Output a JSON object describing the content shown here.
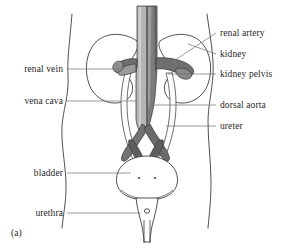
{
  "figure": {
    "caption": "(a)",
    "background_color": "#ffffff",
    "line_color": "#3a3a3a",
    "vena_cava_color": "#b3b3b3",
    "aorta_color": "#7a7a7a",
    "renal_vessel_dark": "#6e6e6e",
    "leader_color": "#6f6f6f"
  },
  "labels_left": [
    {
      "name": "renal-vein",
      "text": "renal vein",
      "text_right_x": 63,
      "text_y": 64,
      "leader_x1": 67,
      "leader_x2": 124,
      "leader_y": 69
    },
    {
      "name": "vena-cava",
      "text": "vena cava",
      "text_right_x": 63,
      "text_y": 96,
      "leader_x1": 67,
      "leader_x2": 136,
      "leader_y": 101
    },
    {
      "name": "bladder",
      "text": "bladder",
      "text_right_x": 63,
      "text_y": 168,
      "leader_x1": 67,
      "leader_x2": 131,
      "leader_y": 173
    },
    {
      "name": "urethra",
      "text": "urethra",
      "text_right_x": 63,
      "text_y": 208,
      "leader_x1": 67,
      "leader_x2": 140,
      "leader_y": 213
    }
  ],
  "labels_right": [
    {
      "name": "renal-artery",
      "text": "renal artery",
      "text_left_x": 220,
      "text_y": 28,
      "leader_x1": 216,
      "leader_y1": 33,
      "leader_x2": 163,
      "leader_y2": 64
    },
    {
      "name": "kidney",
      "text": "kidney",
      "text_left_x": 220,
      "text_y": 49,
      "leader_x1": 216,
      "leader_y1": 54,
      "leader_x2": 186,
      "leader_y2": 44
    },
    {
      "name": "kidney-pelvis",
      "text": "kidney pelvis",
      "text_left_x": 220,
      "text_y": 69,
      "leader_x1": 216,
      "leader_y1": 74,
      "leader_x2": 166,
      "leader_y2": 74
    },
    {
      "name": "dorsal-aorta",
      "text": "dorsal aorta",
      "text_left_x": 220,
      "text_y": 100,
      "leader_x1": 216,
      "leader_y1": 105,
      "leader_x2": 151,
      "leader_y2": 105
    },
    {
      "name": "ureter",
      "text": "ureter",
      "text_left_x": 220,
      "text_y": 121,
      "leader_x1": 216,
      "leader_y1": 126,
      "leader_x2": 163,
      "leader_y2": 126
    }
  ],
  "structures": [
    {
      "name": "body-outline-left",
      "description": "torso contour left"
    },
    {
      "name": "body-outline-right",
      "description": "torso contour right"
    },
    {
      "name": "kidney-left",
      "description": "bean shaped kidney"
    },
    {
      "name": "kidney-right",
      "description": "bean shaped kidney"
    },
    {
      "name": "vena-cava-vessel",
      "description": "light grey vessel"
    },
    {
      "name": "dorsal-aorta-vessel",
      "description": "dark grey vessel"
    },
    {
      "name": "renal-artery-vessel",
      "description": "branch to kidney"
    },
    {
      "name": "renal-vein-vessel",
      "description": "branch to kidney"
    },
    {
      "name": "iliac-bifurcation",
      "description": "Y shaped split"
    },
    {
      "name": "ureter-left",
      "description": "tube to bladder"
    },
    {
      "name": "ureter-right",
      "description": "tube to bladder"
    },
    {
      "name": "bladder",
      "description": "urinary bladder"
    },
    {
      "name": "ureter-opening-left",
      "description": "orifice dot"
    },
    {
      "name": "ureter-opening-right",
      "description": "orifice dot"
    },
    {
      "name": "urethra-tube",
      "description": "urethra outlet"
    }
  ]
}
